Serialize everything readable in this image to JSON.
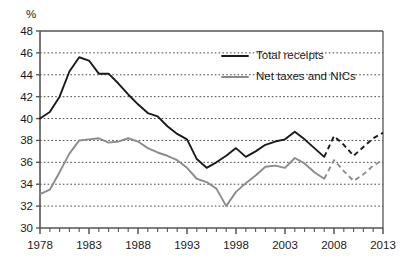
{
  "chart_data": {
    "type": "line",
    "title": "",
    "subtitle": "",
    "xlabel": "",
    "ylabel": "%",
    "ylim": [
      30,
      48
    ],
    "xlim": [
      1978,
      2013
    ],
    "y_ticks": [
      30,
      32,
      34,
      36,
      38,
      40,
      42,
      44,
      46,
      48
    ],
    "x_ticks": [
      1978,
      1983,
      1988,
      1993,
      1998,
      2003,
      2008,
      2013
    ],
    "x_tick_labels": [
      "1978",
      "1983",
      "1988",
      "1993",
      "1998",
      "2003",
      "2008",
      "2013"
    ],
    "y_tick_labels": [
      "30",
      "32",
      "34",
      "36",
      "38",
      "40",
      "42",
      "44",
      "46",
      "48"
    ],
    "x_minor_tick_step": 1,
    "grid": "horizontal-dotted",
    "legend_position": "top-right-inside",
    "x": [
      1978,
      1979,
      1980,
      1981,
      1982,
      1983,
      1984,
      1985,
      1986,
      1987,
      1988,
      1989,
      1990,
      1991,
      1992,
      1993,
      1994,
      1995,
      1996,
      1997,
      1998,
      1999,
      2000,
      2001,
      2002,
      2003,
      2004,
      2005,
      2006,
      2007,
      2008,
      2009,
      2010,
      2011,
      2012,
      2013
    ],
    "series": [
      {
        "name": "Total receipts",
        "color": "#1a1a1a",
        "values": [
          40.0,
          40.6,
          42.0,
          44.3,
          45.6,
          45.3,
          44.1,
          44.1,
          43.2,
          42.2,
          41.3,
          40.5,
          40.2,
          39.3,
          38.6,
          38.1,
          36.3,
          35.5,
          36.0,
          36.6,
          37.3,
          36.5,
          37.0,
          37.6,
          37.9,
          38.1,
          38.8,
          38.1,
          37.3,
          36.5,
          36.7,
          37.5,
          38.6,
          38.7,
          38.8,
          38.6
        ],
        "solid_through": 2007,
        "forecast_style": "dashed",
        "forecast_values": {
          "2008": 38.4,
          "2009": 37.6,
          "2010": 36.6,
          "2011": 37.4,
          "2012": 38.2,
          "2013": 38.7
        }
      },
      {
        "name": "Net taxes and NICs",
        "color": "#8c8c8c",
        "values": [
          33.1,
          33.5,
          35.1,
          36.8,
          38.0,
          38.1,
          38.2,
          37.8,
          37.9,
          38.2,
          37.9,
          37.3,
          36.9,
          36.6,
          36.2,
          35.5,
          34.5,
          34.2,
          33.6,
          32.0,
          33.3,
          34.1,
          34.8,
          35.6,
          35.7,
          35.5,
          36.4,
          35.9,
          35.1,
          34.5,
          34.5,
          35.3,
          36.1,
          36.2,
          36.4,
          36.4
        ],
        "solid_through": 2007,
        "forecast_style": "dashed",
        "forecast_values": {
          "2008": 36.2,
          "2009": 35.2,
          "2010": 34.3,
          "2011": 34.9,
          "2012": 35.7,
          "2013": 36.2
        }
      }
    ],
    "notes": {
      "forecast_start_year": 2008,
      "forecast_description": "Dashed line segments from 2008 onwards indicate forecast values."
    }
  },
  "legend": {
    "items": [
      {
        "label": "Total receipts",
        "color": "#1a1a1a"
      },
      {
        "label": "Net taxes and NICs",
        "color": "#8c8c8c"
      }
    ]
  },
  "axes": {
    "y_unit_label": "%"
  }
}
